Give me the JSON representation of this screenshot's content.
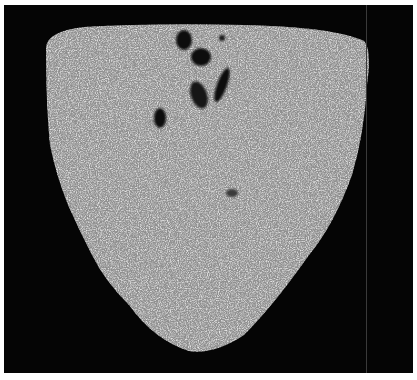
{
  "image": {
    "subject": "micrograph of weld fusion zone cross-section",
    "background_color": "#050505",
    "region_color": "#a3a3a3",
    "pore_color": "#0a0a0a",
    "pores": [
      {
        "cx": 180,
        "cy": 35,
        "rx": 8,
        "ry": 10
      },
      {
        "cx": 197,
        "cy": 52,
        "rx": 10,
        "ry": 9
      },
      {
        "cx": 195,
        "cy": 90,
        "rx": 8,
        "ry": 14
      },
      {
        "cx": 218,
        "cy": 80,
        "rx": 5,
        "ry": 18
      },
      {
        "cx": 156,
        "cy": 113,
        "rx": 6,
        "ry": 10
      },
      {
        "cx": 218,
        "cy": 33,
        "rx": 3,
        "ry": 3
      }
    ]
  }
}
